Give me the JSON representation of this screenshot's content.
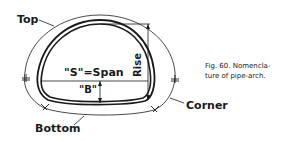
{
  "figure": {
    "caption_line1": "Fig. 60. Nomencla-",
    "caption_line2": "ture of pipe-arch."
  },
  "labels": {
    "top": "Top",
    "bottom": "Bottom",
    "corner": "Corner",
    "span": "\"S\"=Span",
    "b": "\"B\"",
    "rise": "Rise"
  },
  "colors": {
    "line": "#1a1a1a",
    "background": "#ffffff"
  }
}
